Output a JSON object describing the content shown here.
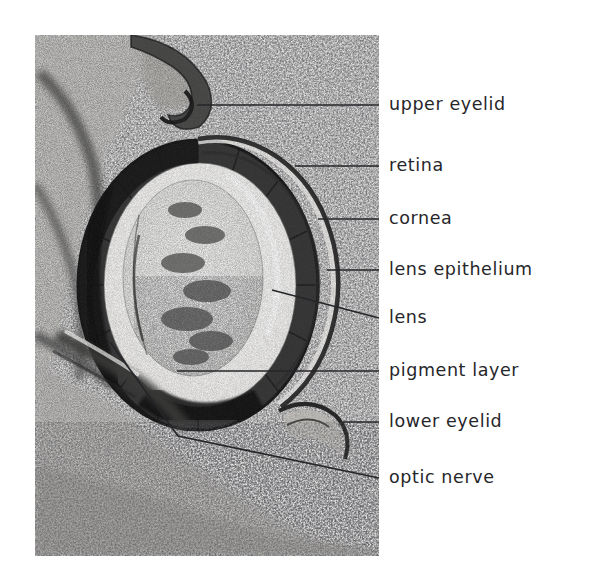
{
  "figure": {
    "kind": "histological-micrograph",
    "background_color": "#ffffff",
    "ink_color": "#26262a",
    "photo": {
      "x": 35,
      "y": 35,
      "width": 344,
      "height": 521
    }
  },
  "labels": [
    {
      "id": "upper-eyelid",
      "text": "upper eyelid",
      "text_x": 389,
      "text_y": 105,
      "leader": {
        "type": "straight",
        "x1": 197,
        "y1": 105,
        "x2": 379,
        "y2": 105
      }
    },
    {
      "id": "retina",
      "text": "retina",
      "text_x": 389,
      "text_y": 166,
      "leader": {
        "type": "straight",
        "x1": 295,
        "y1": 166,
        "x2": 379,
        "y2": 166
      }
    },
    {
      "id": "cornea",
      "text": "cornea",
      "text_x": 389,
      "text_y": 219,
      "leader": {
        "type": "straight",
        "x1": 318,
        "y1": 219,
        "x2": 379,
        "y2": 219
      }
    },
    {
      "id": "lens-epithelium",
      "text": "lens epithelium",
      "text_x": 389,
      "text_y": 270,
      "leader": {
        "type": "straight",
        "x1": 327,
        "y1": 270,
        "x2": 379,
        "y2": 270
      }
    },
    {
      "id": "lens",
      "text": "lens",
      "text_x": 389,
      "text_y": 318,
      "leader": {
        "type": "straight",
        "x1": 272,
        "y1": 290,
        "x2": 379,
        "y2": 318
      }
    },
    {
      "id": "pigment-layer",
      "text": "pigment layer",
      "text_x": 389,
      "text_y": 371,
      "leader": {
        "type": "straight",
        "x1": 177,
        "y1": 371,
        "x2": 379,
        "y2": 371
      }
    },
    {
      "id": "lower-eyelid",
      "text": "lower eyelid",
      "text_x": 389,
      "text_y": 422,
      "leader": {
        "type": "straight",
        "x1": 343,
        "y1": 422,
        "x2": 379,
        "y2": 422
      }
    },
    {
      "id": "optic-nerve",
      "text": "optic nerve",
      "text_x": 389,
      "text_y": 478,
      "leader": {
        "type": "bent",
        "x1": 110,
        "y1": 342,
        "x2": 178,
        "y2": 436,
        "x3": 379,
        "y3": 478
      }
    }
  ]
}
